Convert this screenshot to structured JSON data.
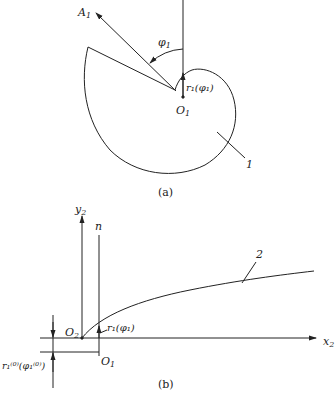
{
  "figure_a": {
    "caption": "(a)",
    "labels": {
      "ray": "A",
      "ray_sub": "1",
      "angle": "φ",
      "angle_sub": "1",
      "radius": "r₁(φ₁)",
      "origin": "O",
      "origin_sub": "1",
      "part": "1"
    }
  },
  "figure_b": {
    "caption": "(b)",
    "labels": {
      "y_axis": "y",
      "y_axis_sub": "2",
      "normal": "n",
      "x_axis": "x",
      "x_axis_sub": "2",
      "origin2": "O",
      "origin2_sub": "2",
      "origin1": "O",
      "origin1_sub": "1",
      "radius": "r₁(φ₁)",
      "initial_radius": "r₁⁽⁰⁾(φ₁⁽⁰⁾)",
      "part": "2"
    }
  },
  "colors": {
    "stroke": "#222222",
    "background": "#ffffff"
  }
}
